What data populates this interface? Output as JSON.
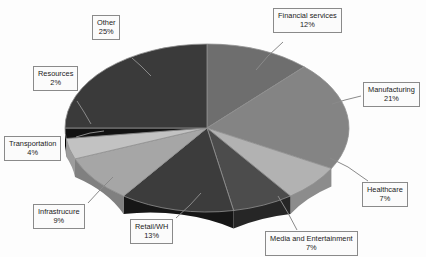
{
  "chart_data": {
    "type": "pie",
    "title": "",
    "subtitle": "",
    "xlabel": "",
    "ylabel": "",
    "legend_position": "none",
    "grid": false,
    "labels_show_percent": true,
    "style": "3d-exploded-grayscale",
    "categories": [
      "Financial services",
      "Manufacturing",
      "Healthcare",
      "Media and Entertainment",
      "Retail/WH",
      "Infrastrucure",
      "Transportation",
      "Resources",
      "Other"
    ],
    "values": [
      12,
      21,
      7,
      7,
      13,
      9,
      4,
      2,
      25
    ],
    "value_labels": [
      "12%",
      "21%",
      "7%",
      "7%",
      "13%",
      "9%",
      "4%",
      "2%",
      "25%"
    ],
    "total": 100,
    "units": "percent",
    "colors": [
      "#6e6e6e",
      "#848484",
      "#b2b2b2",
      "#4c4c4c",
      "#3c3c3c",
      "#a6a6a6",
      "#c2c2c2",
      "#121212",
      "#3a3a3a"
    ],
    "slices": [
      {
        "name": "Financial services",
        "value": 12,
        "label": "12%",
        "color": "#6e6e6e"
      },
      {
        "name": "Manufacturing",
        "value": 21,
        "label": "21%",
        "color": "#848484"
      },
      {
        "name": "Healthcare",
        "value": 7,
        "label": "7%",
        "color": "#b2b2b2"
      },
      {
        "name": "Media and Entertainment",
        "value": 7,
        "label": "7%",
        "color": "#4c4c4c"
      },
      {
        "name": "Retail/WH",
        "value": 13,
        "label": "13%",
        "color": "#3c3c3c"
      },
      {
        "name": "Infrastrucure",
        "value": 9,
        "label": "9%",
        "color": "#a6a6a6"
      },
      {
        "name": "Transportation",
        "value": 4,
        "label": "4%",
        "color": "#c2c2c2"
      },
      {
        "name": "Resources",
        "value": 2,
        "label": "2%",
        "color": "#121212"
      },
      {
        "name": "Other",
        "value": 25,
        "label": "25%",
        "color": "#3a3a3a"
      }
    ]
  },
  "callouts": {
    "financial_services": {
      "label": "Financial services",
      "percent": "12%"
    },
    "manufacturing": {
      "label": "Manufacturing",
      "percent": "21%"
    },
    "healthcare": {
      "label": "Healthcare",
      "percent": "7%"
    },
    "media_entertainment": {
      "label": "Media and Entertainment",
      "percent": "7%"
    },
    "retail_wh": {
      "label": "Retail/WH",
      "percent": "13%"
    },
    "infrastructure": {
      "label": "Infrastrucure",
      "percent": "9%"
    },
    "transportation": {
      "label": "Transportation",
      "percent": "4%"
    },
    "resources": {
      "label": "Resources",
      "percent": "2%"
    },
    "other": {
      "label": "Other",
      "percent": "25%"
    }
  }
}
